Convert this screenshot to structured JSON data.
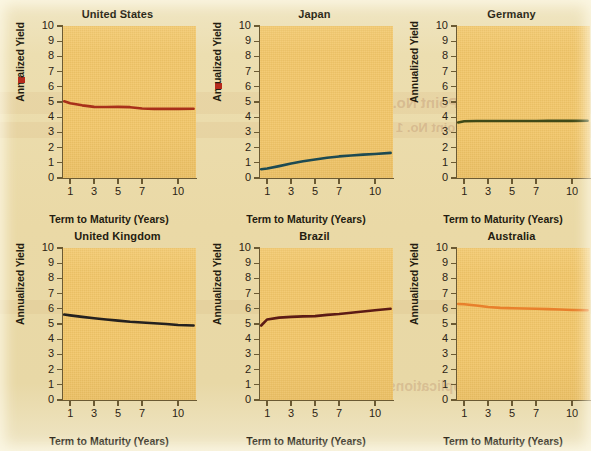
{
  "figure": {
    "panel_count": 6,
    "y_axis_label": "Annualized Yield",
    "x_axis_label": "Term to Maturity (Years)",
    "y_ticks": [
      "10",
      "9",
      "8",
      "7",
      "6",
      "5",
      "4",
      "3",
      "2",
      "1",
      "0"
    ],
    "x_ticks": [
      "1",
      "3",
      "5",
      "7",
      "10"
    ],
    "plot_background_color": "#f2c668",
    "page_background_color": "#ecdeb0",
    "axis_color": "#6b5a33",
    "text_color": "#241c10"
  },
  "bleed_through_text": [
    "Point-CounterPoint No. 1",
    "CounterPoint No. 1",
    "Questions and Applications"
  ],
  "chart_data": [
    {
      "type": "line",
      "title": "United States",
      "xlabel": "Term to Maturity (Years)",
      "ylabel": "Annualized Yield",
      "xlim": [
        0.4,
        11.5
      ],
      "ylim": [
        0,
        10
      ],
      "x_ticks": [
        1,
        3,
        5,
        7,
        10
      ],
      "y_ticks": [
        0,
        1,
        2,
        3,
        4,
        5,
        6,
        7,
        8,
        9,
        10
      ],
      "grid": false,
      "legend": "none",
      "line_color": "#a8301a",
      "x": [
        0.5,
        1,
        2,
        3,
        4,
        5,
        6,
        7,
        8,
        9,
        10,
        11.3
      ],
      "values": [
        5.05,
        4.92,
        4.78,
        4.68,
        4.67,
        4.68,
        4.66,
        4.57,
        4.55,
        4.55,
        4.55,
        4.56
      ]
    },
    {
      "type": "line",
      "title": "Japan",
      "xlabel": "Term to Maturity (Years)",
      "ylabel": "Annualized Yield",
      "xlim": [
        0.4,
        11.5
      ],
      "ylim": [
        0,
        10
      ],
      "x_ticks": [
        1,
        3,
        5,
        7,
        10
      ],
      "y_ticks": [
        0,
        1,
        2,
        3,
        4,
        5,
        6,
        7,
        8,
        9,
        10
      ],
      "grid": false,
      "legend": "none",
      "line_color": "#1d4a52",
      "x": [
        0.5,
        1,
        2,
        3,
        4,
        5,
        6,
        7,
        8,
        9,
        10,
        11.3
      ],
      "values": [
        0.58,
        0.62,
        0.78,
        0.95,
        1.1,
        1.22,
        1.33,
        1.42,
        1.48,
        1.54,
        1.58,
        1.65
      ]
    },
    {
      "type": "line",
      "title": "Germany",
      "xlabel": "Term to Maturity (Years)",
      "ylabel": "Annualized Yield",
      "xlim": [
        0.4,
        11.5
      ],
      "ylim": [
        0,
        10
      ],
      "x_ticks": [
        1,
        3,
        5,
        7,
        10
      ],
      "y_ticks": [
        0,
        1,
        2,
        3,
        4,
        5,
        6,
        7,
        8,
        9,
        10
      ],
      "grid": false,
      "legend": "none",
      "line_color": "#3f4a17",
      "x": [
        0.5,
        1,
        2,
        3,
        4,
        5,
        6,
        7,
        8,
        9,
        10,
        11.3
      ],
      "values": [
        3.65,
        3.73,
        3.75,
        3.75,
        3.75,
        3.75,
        3.75,
        3.75,
        3.76,
        3.76,
        3.76,
        3.77
      ]
    },
    {
      "type": "line",
      "title": "United Kingdom",
      "xlabel": "Term to Maturity (Years)",
      "ylabel": "Annualized Yield",
      "xlim": [
        0.4,
        11.5
      ],
      "ylim": [
        0,
        10
      ],
      "x_ticks": [
        1,
        3,
        5,
        7,
        10
      ],
      "y_ticks": [
        0,
        1,
        2,
        3,
        4,
        5,
        6,
        7,
        8,
        9,
        10
      ],
      "grid": false,
      "legend": "none",
      "line_color": "#24211f",
      "x": [
        0.5,
        1,
        2,
        3,
        4,
        5,
        6,
        7,
        8,
        9,
        10,
        11.3
      ],
      "values": [
        5.62,
        5.57,
        5.47,
        5.38,
        5.3,
        5.22,
        5.15,
        5.1,
        5.05,
        5.0,
        4.93,
        4.9
      ]
    },
    {
      "type": "line",
      "title": "Brazil",
      "xlabel": "Term to Maturity (Years)",
      "ylabel": "Annualized Yield",
      "xlim": [
        0.4,
        11.5
      ],
      "ylim": [
        0,
        10
      ],
      "x_ticks": [
        1,
        3,
        5,
        7,
        10
      ],
      "y_ticks": [
        0,
        1,
        2,
        3,
        4,
        5,
        6,
        7,
        8,
        9,
        10
      ],
      "grid": false,
      "legend": "none",
      "line_color": "#5c1b15",
      "x": [
        0.5,
        1,
        2,
        3,
        4,
        5,
        6,
        7,
        8,
        9,
        10,
        11.3
      ],
      "values": [
        4.9,
        5.3,
        5.42,
        5.47,
        5.5,
        5.52,
        5.6,
        5.66,
        5.74,
        5.82,
        5.9,
        6.0
      ]
    },
    {
      "type": "line",
      "title": "Australia",
      "xlabel": "Term to Maturity (Years)",
      "ylabel": "Annualized Yield",
      "xlim": [
        0.4,
        11.5
      ],
      "ylim": [
        0,
        10
      ],
      "x_ticks": [
        1,
        3,
        5,
        7,
        10
      ],
      "y_ticks": [
        0,
        1,
        2,
        3,
        4,
        5,
        6,
        7,
        8,
        9,
        10
      ],
      "grid": false,
      "legend": "none",
      "line_color": "#e8802c",
      "x": [
        0.5,
        1,
        2,
        3,
        4,
        5,
        6,
        7,
        8,
        9,
        10,
        11.3
      ],
      "values": [
        6.32,
        6.3,
        6.22,
        6.12,
        6.06,
        6.04,
        6.02,
        6.0,
        5.98,
        5.95,
        5.92,
        5.9
      ]
    }
  ]
}
